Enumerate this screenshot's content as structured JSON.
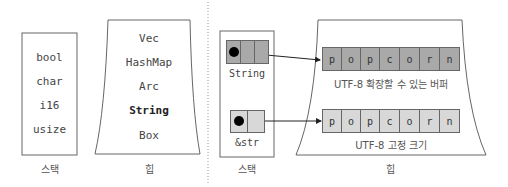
{
  "left_panel": {
    "stack": {
      "label": "스택",
      "items": [
        "bool",
        "char",
        "i16",
        "usize"
      ]
    },
    "heap": {
      "label": "힙",
      "items": [
        "Vec",
        "HashMap",
        "Arc",
        "String",
        "Box"
      ],
      "highlighted": "String"
    }
  },
  "right_panel": {
    "stack": {
      "label": "스택",
      "string_var": "String",
      "str_var": "&str"
    },
    "heap": {
      "label": "힙",
      "string_buffer": {
        "chars": [
          "p",
          "o",
          "p",
          "c",
          "o",
          "r",
          "n"
        ],
        "caption": "UTF-8 확장할 수 있는 버퍼"
      },
      "str_buffer": {
        "chars": [
          "p",
          "o",
          "p",
          "c",
          "o",
          "r",
          "n"
        ],
        "caption": "UTF-8 고정 크기"
      }
    }
  },
  "colors": {
    "string_cells": "#a9a9a9",
    "str_cells": "#d8d8d8",
    "outline": "#666666"
  }
}
